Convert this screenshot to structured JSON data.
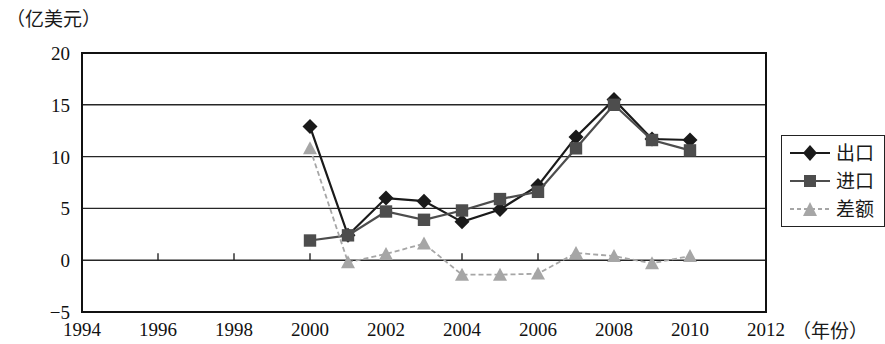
{
  "unit_label": "（亿美元）",
  "xaxis_title": "（年份）",
  "legend": {
    "items": [
      {
        "label": "出口",
        "marker": "diamond",
        "color": "#1a1a1a"
      },
      {
        "label": "进口",
        "marker": "square",
        "color": "#4d4d4d"
      },
      {
        "label": "差额",
        "marker": "triangle",
        "color": "#a6a6a6"
      }
    ]
  },
  "chart_data": {
    "type": "line",
    "title": "",
    "subtitle": "",
    "xlabel": "（年份）",
    "ylabel": "（亿美元）",
    "xlim": [
      1994,
      2012
    ],
    "ylim": [
      -5,
      20
    ],
    "xticks": [
      1994,
      1996,
      1998,
      2000,
      2002,
      2004,
      2006,
      2008,
      2010,
      2012
    ],
    "yticks": [
      -5,
      0,
      5,
      10,
      15,
      20
    ],
    "xtick_labels": [
      "1994",
      "1996",
      "1998",
      "2000",
      "2002",
      "2004",
      "2006",
      "2008",
      "2010",
      "2012"
    ],
    "ytick_labels": [
      "−5",
      "0",
      "5",
      "10",
      "15",
      "20"
    ],
    "grid": true,
    "grid_axis": "y",
    "legend_position": "right",
    "x": [
      2000,
      2001,
      2002,
      2003,
      2004,
      2005,
      2006,
      2007,
      2008,
      2009,
      2010
    ],
    "series": [
      {
        "name": "出口",
        "marker": "diamond",
        "color": "#1a1a1a",
        "values": [
          12.9,
          2.4,
          6.0,
          5.7,
          3.7,
          4.9,
          7.2,
          11.9,
          15.5,
          11.7,
          11.6
        ]
      },
      {
        "name": "进口",
        "marker": "square",
        "color": "#4d4d4d",
        "values": [
          1.9,
          2.4,
          4.7,
          3.9,
          4.8,
          5.9,
          6.6,
          10.8,
          15.0,
          11.6,
          10.6
        ]
      },
      {
        "name": "差额",
        "marker": "triangle",
        "color": "#a6a6a6",
        "values": [
          10.8,
          -0.2,
          0.6,
          1.6,
          -1.4,
          -1.4,
          -1.3,
          0.7,
          0.4,
          -0.3,
          0.4
        ]
      }
    ]
  }
}
